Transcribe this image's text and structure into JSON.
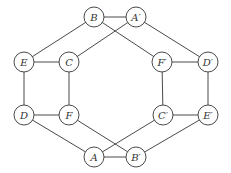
{
  "diagram": {
    "type": "graph",
    "nodes": [
      {
        "id": "B",
        "label": "B"
      },
      {
        "id": "A'",
        "label": "A′"
      },
      {
        "id": "E",
        "label": "E"
      },
      {
        "id": "C",
        "label": "C"
      },
      {
        "id": "F'",
        "label": "F′"
      },
      {
        "id": "D'",
        "label": "D′"
      },
      {
        "id": "D",
        "label": "D"
      },
      {
        "id": "F",
        "label": "F"
      },
      {
        "id": "C'",
        "label": "C′"
      },
      {
        "id": "E'",
        "label": "E′"
      },
      {
        "id": "A",
        "label": "A"
      },
      {
        "id": "B'",
        "label": "B′"
      }
    ],
    "edges": [
      [
        "B",
        "A'"
      ],
      [
        "B",
        "E"
      ],
      [
        "B",
        "F'"
      ],
      [
        "A'",
        "C"
      ],
      [
        "A'",
        "D'"
      ],
      [
        "E",
        "C"
      ],
      [
        "F'",
        "D'"
      ],
      [
        "E",
        "D"
      ],
      [
        "C",
        "F"
      ],
      [
        "F'",
        "C'"
      ],
      [
        "D'",
        "E'"
      ],
      [
        "D",
        "F"
      ],
      [
        "C'",
        "E'"
      ],
      [
        "D",
        "A"
      ],
      [
        "F",
        "B'"
      ],
      [
        "C'",
        "A"
      ],
      [
        "E'",
        "B'"
      ],
      [
        "A",
        "B'"
      ]
    ]
  }
}
